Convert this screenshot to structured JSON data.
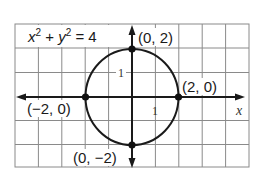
{
  "figure": {
    "equation": {
      "x_var": "x",
      "x_exp": "2",
      "plus": " + ",
      "y_var": "y",
      "y_exp": "2",
      "equals": " = 4"
    },
    "axis_labels": {
      "x": "x"
    },
    "tick_labels": {
      "y_one": "1",
      "x_one": "1"
    },
    "points": [
      {
        "label": "(0, 2)",
        "x": 0,
        "y": 2
      },
      {
        "label": "(2, 0)",
        "x": 2,
        "y": 0
      },
      {
        "label": "(−2, 0)",
        "x": -2,
        "y": 0
      },
      {
        "label": "(0, −2)",
        "x": 0,
        "y": -2
      }
    ],
    "circle": {
      "center": [
        0,
        0
      ],
      "radius": 2
    },
    "grid": {
      "columns": 10,
      "rows": 6,
      "x_range": [
        -5,
        5
      ],
      "y_range": [
        -3,
        3
      ]
    },
    "colors": {
      "line": "#1a1a1a",
      "grid": "#8a8a8a",
      "background": "#ffffff"
    }
  }
}
